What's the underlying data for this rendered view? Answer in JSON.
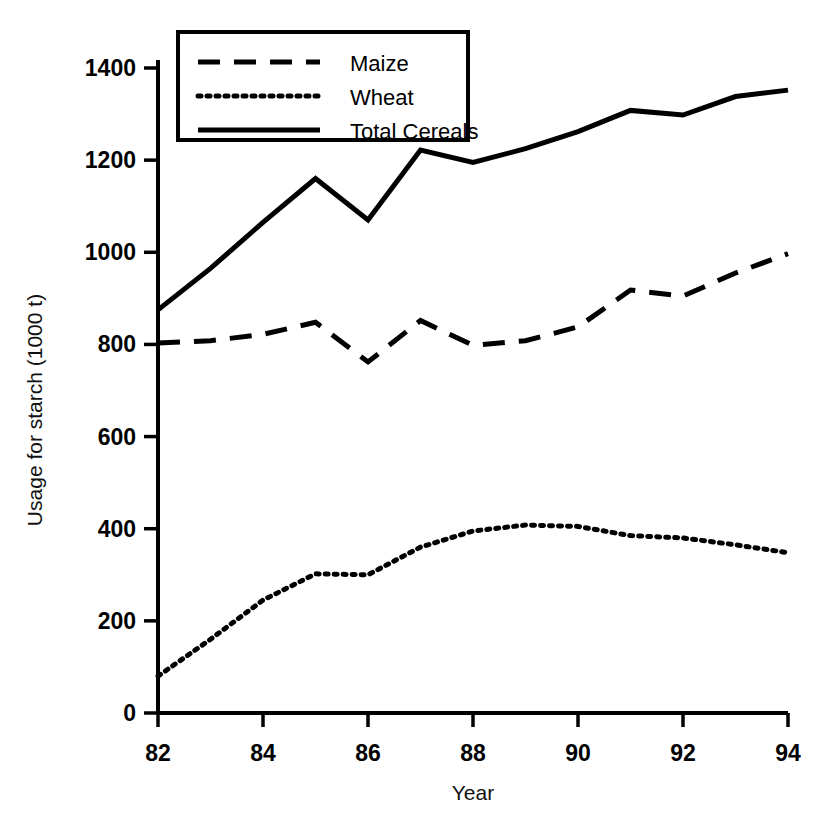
{
  "chart_data": {
    "type": "line",
    "title": "",
    "xlabel": "Year",
    "ylabel": "Usage for starch (1000 t)",
    "xlim": [
      82,
      94
    ],
    "ylim": [
      0,
      1400
    ],
    "grid": false,
    "legend_position": "top-left-inside",
    "x": [
      82,
      83,
      84,
      85,
      86,
      87,
      88,
      89,
      90,
      91,
      92,
      93,
      94
    ],
    "xtick_labels": [
      "82",
      "84",
      "86",
      "88",
      "90",
      "92",
      "94"
    ],
    "xtick_values": [
      82,
      84,
      86,
      88,
      90,
      92,
      94
    ],
    "ytick_labels": [
      "0",
      "200",
      "400",
      "600",
      "800",
      "1000",
      "1200",
      "1400"
    ],
    "ytick_values": [
      0,
      200,
      400,
      600,
      800,
      1000,
      1200,
      1400
    ],
    "series": [
      {
        "name": "Maize",
        "style": "dashed",
        "values": [
          803,
          808,
          822,
          848,
          762,
          852,
          798,
          808,
          838,
          918,
          905,
          955,
          997
        ]
      },
      {
        "name": "Wheat",
        "style": "dotted",
        "values": [
          80,
          160,
          245,
          302,
          300,
          360,
          395,
          408,
          405,
          385,
          380,
          365,
          348
        ]
      },
      {
        "name": "Total Cereals",
        "style": "solid",
        "values": [
          875,
          965,
          1065,
          1160,
          1070,
          1222,
          1195,
          1225,
          1262,
          1308,
          1298,
          1338,
          1352
        ]
      }
    ]
  },
  "legend": {
    "entries": [
      {
        "label": "Maize",
        "style": "dashed"
      },
      {
        "label": "Wheat",
        "style": "dotted"
      },
      {
        "label": "Total Cereals",
        "style": "solid"
      }
    ]
  },
  "colors": {
    "line": "#000000",
    "axis": "#000000",
    "background": "#ffffff"
  }
}
